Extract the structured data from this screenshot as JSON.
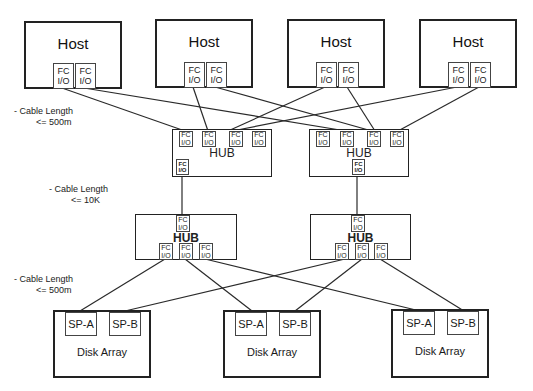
{
  "diagram": {
    "type": "fibre-channel-san-topology",
    "hosts": [
      {
        "label": "Host",
        "ports": [
          {
            "line1": "FC",
            "line2": "I/O"
          },
          {
            "line1": "FC",
            "line2": "I/O"
          }
        ]
      },
      {
        "label": "Host",
        "ports": [
          {
            "line1": "FC",
            "line2": "I/O"
          },
          {
            "line1": "FC",
            "line2": "I/O"
          }
        ]
      },
      {
        "label": "Host",
        "ports": [
          {
            "line1": "FC",
            "line2": "I/O"
          },
          {
            "line1": "FC",
            "line2": "I/O"
          }
        ]
      },
      {
        "label": "Host",
        "ports": [
          {
            "line1": "FC",
            "line2": "I/O"
          },
          {
            "line1": "FC",
            "line2": "I/O"
          }
        ]
      }
    ],
    "upper_hubs": [
      {
        "label": "HUB",
        "port_label": {
          "line1": "FC",
          "line2": "I/O"
        }
      },
      {
        "label": "HUB",
        "port_label": {
          "line1": "FC",
          "line2": "I/O"
        }
      }
    ],
    "lower_hubs": [
      {
        "label": "HUB",
        "port_label": {
          "line1": "FC",
          "line2": "I/O"
        }
      },
      {
        "label": "HUB",
        "port_label": {
          "line1": "FC",
          "line2": "I/O"
        }
      }
    ],
    "disk_arrays": [
      {
        "label": "Disk Array",
        "sp_a": "SP-A",
        "sp_b": "SP-B"
      },
      {
        "label": "Disk Array",
        "sp_a": "SP-A",
        "sp_b": "SP-B"
      },
      {
        "label": "Disk Array",
        "sp_a": "SP-A",
        "sp_b": "SP-B"
      }
    ],
    "annotations": [
      {
        "line1": "- Cable Length",
        "line2": "<= 500m"
      },
      {
        "line1": "- Cable Length",
        "line2": "<= 10K"
      },
      {
        "line1": "- Cable Length",
        "line2": "<= 500m"
      }
    ],
    "connections": [
      {
        "from": "host1.port1",
        "to": "upper_hub1.port1"
      },
      {
        "from": "host1.port2",
        "to": "upper_hub2.port2"
      },
      {
        "from": "host2.port1",
        "to": "upper_hub1.port2"
      },
      {
        "from": "host2.port2",
        "to": "upper_hub2.port3"
      },
      {
        "from": "host3.port1",
        "to": "upper_hub1.port3"
      },
      {
        "from": "host3.port2",
        "to": "upper_hub2.port3"
      },
      {
        "from": "host4.port1",
        "to": "upper_hub1.port3"
      },
      {
        "from": "host4.port2",
        "to": "upper_hub2.port4"
      },
      {
        "from": "upper_hub1.downlink",
        "to": "lower_hub1.uplink"
      },
      {
        "from": "upper_hub2.downlink",
        "to": "lower_hub2.uplink"
      },
      {
        "from": "lower_hub1.port1",
        "to": "disk1.sp_a"
      },
      {
        "from": "lower_hub1.port2",
        "to": "disk2.sp_a"
      },
      {
        "from": "lower_hub1.port3",
        "to": "disk3.sp_a"
      },
      {
        "from": "lower_hub2.port1",
        "to": "disk1.sp_b"
      },
      {
        "from": "lower_hub2.port2",
        "to": "disk2.sp_b"
      },
      {
        "from": "lower_hub2.port3",
        "to": "disk3.sp_b"
      }
    ]
  }
}
